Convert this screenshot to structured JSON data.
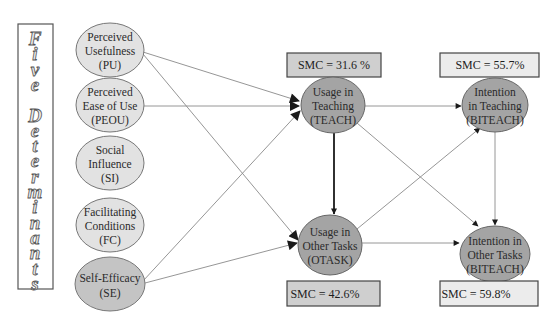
{
  "title_box": {
    "label": "Five Determinants",
    "letters": [
      "F",
      "i",
      "v",
      "e",
      "",
      "D",
      "e",
      "t",
      "e",
      "r",
      "m",
      "i",
      "n",
      "a",
      "n",
      "t",
      "s"
    ]
  },
  "determinants": [
    {
      "id": "PU",
      "lines": [
        "Perceived",
        "Usefulness",
        "(PU)"
      ]
    },
    {
      "id": "PEOU",
      "lines": [
        "Perceived",
        "Ease of Use",
        "(PEOU)"
      ]
    },
    {
      "id": "SI",
      "lines": [
        "Social",
        "Influence",
        "(SI)"
      ]
    },
    {
      "id": "FC",
      "lines": [
        "Facilitating",
        "Conditions",
        "(FC)"
      ]
    },
    {
      "id": "SE",
      "lines": [
        "Self-Efficacy",
        "(SE)"
      ]
    }
  ],
  "usage": [
    {
      "id": "TEACH",
      "lines": [
        "Usage in",
        "Teaching",
        "(TEACH)"
      ],
      "smc": "SMC = 31.6 %"
    },
    {
      "id": "OTASK",
      "lines": [
        "Usage in",
        "Other Tasks",
        "(OTASK)"
      ],
      "smc": "SMC = 42.6%"
    }
  ],
  "intention": [
    {
      "id": "BITEACH_TEACHING",
      "lines": [
        "Intention",
        "in Teaching",
        "(BITEACH)"
      ],
      "smc": "SMC = 55.7%"
    },
    {
      "id": "BITEACH_OTHER",
      "lines": [
        "Intention in",
        "Other Tasks",
        "(BITEACH)"
      ],
      "smc": "SMC = 59.8%"
    }
  ],
  "edges": [
    {
      "from": "PU",
      "to": "TEACH"
    },
    {
      "from": "PU",
      "to": "OTASK"
    },
    {
      "from": "PEOU",
      "to": "TEACH"
    },
    {
      "from": "SE",
      "to": "TEACH"
    },
    {
      "from": "SE",
      "to": "OTASK"
    },
    {
      "from": "TEACH",
      "to": "OTASK",
      "bold": true
    },
    {
      "from": "TEACH",
      "to": "BITEACH_TEACHING"
    },
    {
      "from": "TEACH",
      "to": "BITEACH_OTHER"
    },
    {
      "from": "OTASK",
      "to": "BITEACH_TEACHING"
    },
    {
      "from": "OTASK",
      "to": "BITEACH_OTHER"
    },
    {
      "from": "BITEACH_TEACHING",
      "to": "BITEACH_OTHER"
    }
  ],
  "colors": {
    "light_node": "#e2e2e2",
    "dark_node": "#a4a4a4",
    "se_node": "#c4c4c4",
    "smc_box_dark": "#cfcfcf",
    "smc_box_light": "#ececec",
    "edge": "#8a8a8a",
    "arrow": "#1a1a1a"
  }
}
